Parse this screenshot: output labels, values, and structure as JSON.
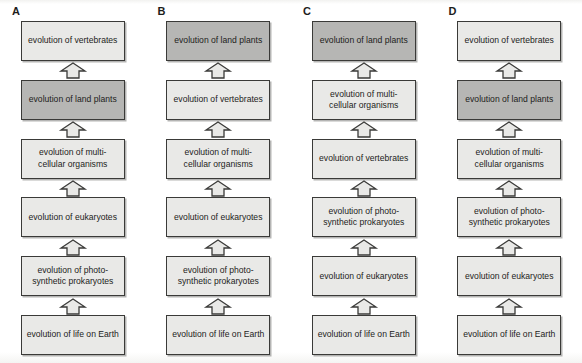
{
  "figure": {
    "background_color": "#fdfdfc",
    "node_fill": "#e9e9e7",
    "node_highlight_fill": "#b6b6b4",
    "node_border_color": "#3a3a38",
    "arrow_icon": "up-block-arrow-icon"
  },
  "columns": [
    {
      "label": "A",
      "nodes": [
        {
          "text": "evolution of vertebrates",
          "highlight": false
        },
        {
          "text": "evolution of land plants",
          "highlight": true
        },
        {
          "text": "evolution of multi-cellular organisms",
          "highlight": false
        },
        {
          "text": "evolution of eukaryotes",
          "highlight": false
        },
        {
          "text": "evolution of photo-synthetic prokaryotes",
          "highlight": false
        },
        {
          "text": "evolution of life on Earth",
          "highlight": false
        }
      ]
    },
    {
      "label": "B",
      "nodes": [
        {
          "text": "evolution of land plants",
          "highlight": true
        },
        {
          "text": "evolution of vertebrates",
          "highlight": false
        },
        {
          "text": "evolution of multi-cellular organisms",
          "highlight": false
        },
        {
          "text": "evolution of eukaryotes",
          "highlight": false
        },
        {
          "text": "evolution of photo-synthetic prokaryotes",
          "highlight": false
        },
        {
          "text": "evolution of life on Earth",
          "highlight": false
        }
      ]
    },
    {
      "label": "C",
      "nodes": [
        {
          "text": "evolution of land plants",
          "highlight": true
        },
        {
          "text": "evolution of multi-cellular organisms",
          "highlight": false
        },
        {
          "text": "evolution of vertebrates",
          "highlight": false
        },
        {
          "text": "evolution of photo-synthetic prokaryotes",
          "highlight": false
        },
        {
          "text": "evolution of eukaryotes",
          "highlight": false
        },
        {
          "text": "evolution of life on Earth",
          "highlight": false
        }
      ]
    },
    {
      "label": "D",
      "nodes": [
        {
          "text": "evolution of vertebrates",
          "highlight": false
        },
        {
          "text": "evolution of land plants",
          "highlight": true
        },
        {
          "text": "evolution of multi-cellular organisms",
          "highlight": false
        },
        {
          "text": "evolution of photo-synthetic prokaryotes",
          "highlight": false
        },
        {
          "text": "evolution of eukaryotes",
          "highlight": false
        },
        {
          "text": "evolution of life on Earth",
          "highlight": false
        }
      ]
    }
  ]
}
